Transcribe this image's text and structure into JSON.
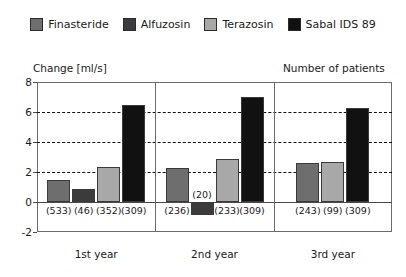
{
  "legend": {
    "items": [
      {
        "label": "Finasteride",
        "color": "#6e6e6e"
      },
      {
        "label": "Alfuzosin",
        "color": "#3b3b3b"
      },
      {
        "label": "Terazosin",
        "color": "#a8a8a8"
      },
      {
        "label": "Sabal IDS 89",
        "color": "#111111"
      }
    ]
  },
  "axes": {
    "left_title": "Change [ml/s]",
    "right_title": "Number of patients",
    "y_ticks": [
      8,
      6,
      4,
      2,
      0,
      -2
    ],
    "y_tick_labels": [
      "8",
      "6",
      "4",
      "2",
      "0",
      "-2"
    ],
    "gridline_values": [
      6,
      4,
      2
    ]
  },
  "groups": [
    {
      "label": "1st year"
    },
    {
      "label": "2nd year"
    },
    {
      "label": "3rd year"
    }
  ],
  "chart_data": {
    "type": "bar",
    "title": "",
    "subtitle": "",
    "xlabel": "",
    "ylabel": "Change [ml/s]",
    "secondary_label": "Number of patients",
    "ylim": [
      -2,
      8
    ],
    "yticks": [
      -2,
      0,
      2,
      4,
      6,
      8
    ],
    "grid": true,
    "gridlines": [
      2,
      4,
      6
    ],
    "legend_position": "top-center",
    "categories": [
      "1st year",
      "2nd year",
      "3rd year"
    ],
    "series": [
      {
        "name": "Finasteride",
        "color": "#6e6e6e",
        "values": [
          1.5,
          2.25,
          2.6
        ],
        "n": [
          533,
          236,
          243
        ]
      },
      {
        "name": "Alfuzosin",
        "color": "#3b3b3b",
        "values": [
          0.85,
          -0.85,
          null
        ],
        "n": [
          46,
          20,
          null
        ]
      },
      {
        "name": "Terazosin",
        "color": "#a8a8a8",
        "values": [
          2.35,
          2.85,
          2.7
        ],
        "n": [
          352,
          233,
          99
        ]
      },
      {
        "name": "Sabal IDS 89",
        "color": "#111111",
        "values": [
          6.5,
          7.0,
          6.25
        ],
        "n": [
          309,
          309,
          309
        ]
      }
    ],
    "n_labels": [
      [
        "(533)",
        "(46)",
        "(352)",
        "(309)"
      ],
      [
        "(236)",
        "(20)",
        "(233)",
        "(309)"
      ],
      [
        "(243)",
        "",
        "(99)",
        "(309)"
      ]
    ]
  }
}
